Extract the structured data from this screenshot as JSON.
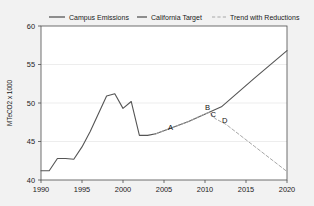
{
  "chart_data": {
    "type": "line",
    "title": "",
    "xlabel": "",
    "ylabel": "MTeCO2 x 1000",
    "xlim": [
      1990,
      2020
    ],
    "ylim": [
      40,
      60
    ],
    "xticks": [
      1990,
      1995,
      2000,
      2005,
      2010,
      2015,
      2020
    ],
    "yticks": [
      40,
      45,
      50,
      55,
      60
    ],
    "grid": "horizontal-light",
    "legend_position": "top",
    "legend": [
      {
        "label": "Campus Emissions",
        "color": "#555555",
        "style": "solid"
      },
      {
        "label": "California Target",
        "color": "#555555",
        "style": "solid"
      },
      {
        "label": "Trend with Reductions",
        "color": "#a8a8a8",
        "style": "dashed"
      }
    ],
    "series": [
      {
        "name": "Campus Emissions",
        "color": "#555555",
        "style": "solid",
        "points": [
          [
            1990,
            41.2
          ],
          [
            1991,
            41.2
          ],
          [
            1992,
            42.8
          ],
          [
            1993,
            42.8
          ],
          [
            1994,
            42.7
          ],
          [
            1995,
            44.3
          ],
          [
            1996,
            46.3
          ],
          [
            1997,
            48.6
          ],
          [
            1998,
            50.9
          ],
          [
            1999,
            51.2
          ],
          [
            2000,
            49.3
          ],
          [
            2001,
            50.2
          ],
          [
            2002,
            45.8
          ],
          [
            2003,
            45.8
          ],
          [
            2004,
            46.0
          ]
        ]
      },
      {
        "name": "California Target",
        "color": "#555555",
        "style": "solid",
        "points": [
          [
            2004,
            46.0
          ],
          [
            2008,
            47.6
          ],
          [
            2012,
            49.5
          ],
          [
            2016,
            53.2
          ],
          [
            2020,
            56.8
          ]
        ]
      },
      {
        "name": "Trend with Reductions",
        "color": "#a8a8a8",
        "style": "dashed",
        "points": [
          [
            2004,
            46.0
          ],
          [
            2006,
            46.8
          ],
          [
            2008,
            47.6
          ],
          [
            2010,
            48.6
          ],
          [
            2010.6,
            48.8
          ],
          [
            2011.2,
            48.0
          ],
          [
            2012.6,
            47.2
          ],
          [
            2016,
            44.4
          ],
          [
            2020,
            41.1
          ]
        ]
      }
    ],
    "annotations": [
      {
        "label": "A",
        "x": 2005.8,
        "y": 46.5
      },
      {
        "label": "B",
        "x": 2010.3,
        "y": 49.1
      },
      {
        "label": "C",
        "x": 2011.0,
        "y": 48.2
      },
      {
        "label": "D",
        "x": 2012.4,
        "y": 47.4
      }
    ]
  }
}
